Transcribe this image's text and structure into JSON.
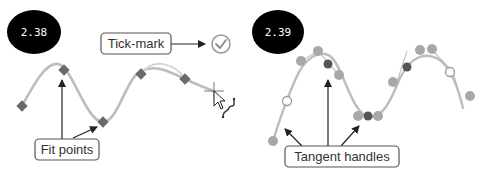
{
  "panels": [
    {
      "id": "left",
      "badge": {
        "label": "2.38"
      },
      "callouts": {
        "tick_mark": "Tick-mark",
        "fit_points": "Fit points"
      },
      "icons": [
        "check-circle-icon",
        "crosshair-cursor-icon",
        "arrow-pointer-icon",
        "spline-icon"
      ],
      "fit_points": [
        [
          22,
          106
        ],
        [
          64,
          70
        ],
        [
          103,
          122
        ],
        [
          141,
          74
        ],
        [
          185,
          79
        ]
      ]
    },
    {
      "id": "right",
      "badge": {
        "label": "2.39"
      },
      "callouts": {
        "tangent_handles": "Tangent handles"
      },
      "fit_points": [
        [
          328,
          64
        ],
        [
          366,
          116
        ],
        [
          408,
          67
        ]
      ],
      "handle_points": [
        [
          301,
          61
        ],
        [
          318,
          51
        ],
        [
          339,
          75
        ],
        [
          358,
          116
        ],
        [
          378,
          116
        ],
        [
          407,
          51
        ],
        [
          432,
          50
        ],
        [
          273,
          141
        ],
        [
          463,
          108
        ]
      ],
      "open_handles": [
        [
          286,
          102
        ],
        [
          453,
          72
        ]
      ]
    }
  ],
  "colors": {
    "badge_bg": "#000000",
    "badge_text": "#ffffff",
    "curve": "#b8b8b8",
    "fit_point": "#666666",
    "handle_point": "#a8a8a8",
    "callout_border": "#555555",
    "arrow": "#222222",
    "check_icon": "#9a9a9a"
  }
}
